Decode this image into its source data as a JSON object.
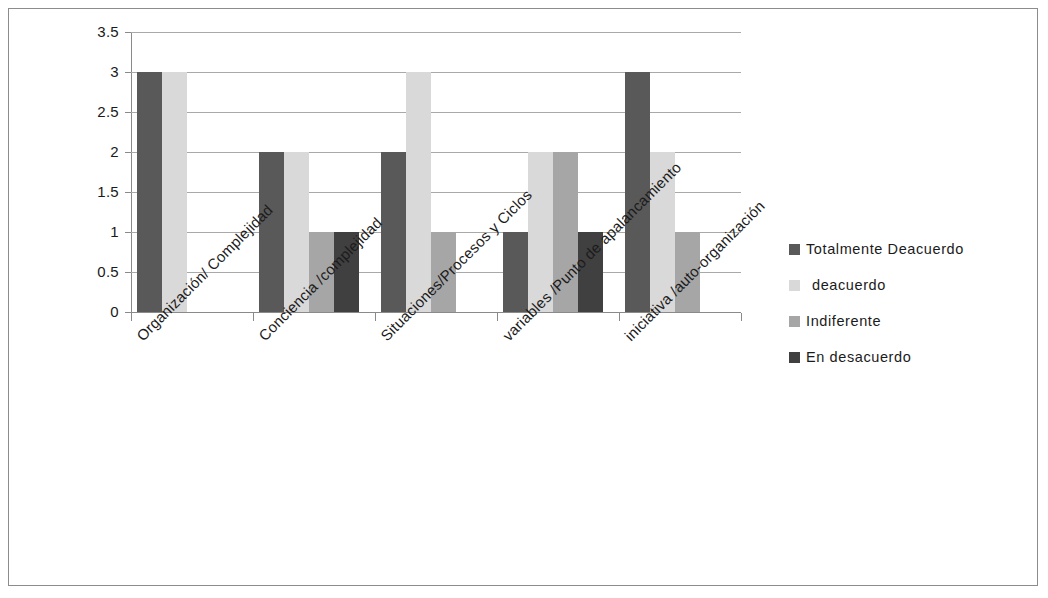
{
  "chart_data": {
    "type": "bar",
    "title": "",
    "xlabel": "",
    "ylabel": "",
    "ylim": [
      0,
      3.5
    ],
    "ytick_step": 0.5,
    "grid": true,
    "legend_position": "right",
    "categories": [
      "Organización/ Complejidad",
      "Conciencia /complejidad",
      "Situaciones/Procesos y Ciclos",
      "variables /Punto de apalancamiento",
      "iniciativa /auto-organización"
    ],
    "ytick_labels": [
      "0",
      "0.5",
      "1",
      "1.5",
      "2",
      "2.5",
      "3",
      "3.5"
    ],
    "ytick_values": [
      0,
      0.5,
      1,
      1.5,
      2,
      2.5,
      3,
      3.5
    ],
    "series": [
      {
        "name": "Totalmente Deacuerdo",
        "color": "#595959",
        "values": [
          3,
          2,
          2,
          1,
          3
        ]
      },
      {
        "name": "deacuerdo",
        "color": "#d9d9d9",
        "values": [
          3,
          2,
          3,
          2,
          2
        ]
      },
      {
        "name": "Indiferente",
        "color": "#a6a6a6",
        "values": [
          0,
          1,
          1,
          2,
          1
        ]
      },
      {
        "name": "En desacuerdo",
        "color": "#404040",
        "values": [
          0,
          1,
          0,
          1,
          0
        ]
      }
    ]
  },
  "legend": {
    "items": [
      {
        "label": "Totalmente Deacuerdo",
        "color": "#595959"
      },
      {
        "label": "deacuerdo",
        "color": "#d9d9d9"
      },
      {
        "label": "Indiferente",
        "color": "#a6a6a6"
      },
      {
        "label": "En desacuerdo",
        "color": "#404040"
      }
    ]
  },
  "colors": {
    "frame_border": "#8c8c8c",
    "gridline": "#a9a9a9",
    "axis": "#8a8a8a",
    "text": "#1b1b1b",
    "background": "#ffffff"
  }
}
